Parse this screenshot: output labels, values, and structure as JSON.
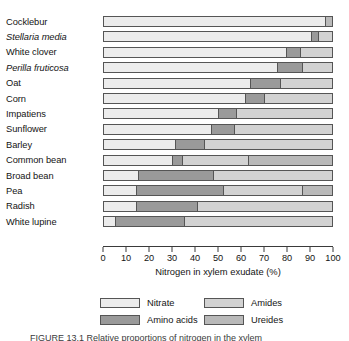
{
  "chart_data": {
    "type": "bar",
    "subtype": "horizontal-stacked-100-percent",
    "title": "",
    "xlabel": "Nitrogen in xylem exudate (%)",
    "ylabel": "",
    "xlim": [
      0,
      100
    ],
    "grid": false,
    "legend_position": "bottom",
    "categories": [
      "Cocklebur",
      "Stellaria media",
      "White clover",
      "Perilla fruticosa",
      "Oat",
      "Corn",
      "Impatiens",
      "Sunflower",
      "Barley",
      "Common bean",
      "Broad bean",
      "Pea",
      "Radish",
      "White lupine"
    ],
    "category_styles": [
      "normal",
      "italic",
      "normal",
      "italic",
      "normal",
      "normal",
      "normal",
      "normal",
      "normal",
      "normal",
      "normal",
      "normal",
      "normal",
      "normal"
    ],
    "series": [
      {
        "name": "Nitrate",
        "color": "#ececec",
        "values": [
          97,
          91,
          80,
          76,
          64,
          62,
          50,
          47,
          31,
          30,
          15,
          14,
          14,
          5
        ]
      },
      {
        "name": "Amino acids",
        "color": "#9a9a9a",
        "values": [
          0,
          3,
          6,
          11,
          13,
          8,
          8,
          10,
          13,
          4,
          33,
          38,
          27,
          30
        ]
      },
      {
        "name": "Amides",
        "color": "#d2d2d2",
        "values": [
          0,
          6,
          14,
          13,
          23,
          30,
          42,
          43,
          56,
          29,
          52,
          35,
          59,
          65
        ]
      },
      {
        "name": "Ureides",
        "color": "#b9b9b9",
        "values": [
          3,
          0,
          0,
          0,
          0,
          0,
          0,
          0,
          0,
          37,
          0,
          13,
          0,
          0
        ]
      }
    ],
    "x_ticks": [
      0,
      10,
      20,
      30,
      40,
      50,
      60,
      70,
      80,
      90,
      100
    ]
  },
  "legend": {
    "items": [
      {
        "label": "Nitrate",
        "color": "#ececec"
      },
      {
        "label": "Amides",
        "color": "#d2d2d2"
      },
      {
        "label": "Amino acids",
        "color": "#9a9a9a"
      },
      {
        "label": "Ureides",
        "color": "#b9b9b9"
      }
    ]
  },
  "caption": {
    "text": "FIGURE 13.1   Relative proportions of nitrogen in the xylem"
  }
}
